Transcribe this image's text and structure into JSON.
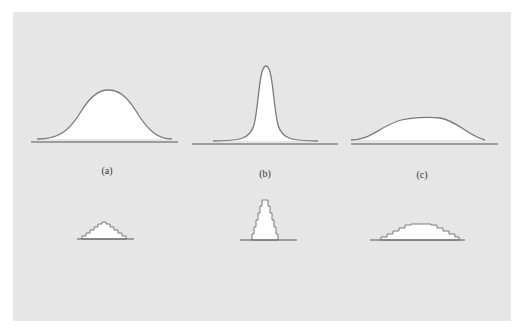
{
  "figure": {
    "background": "#e6e6e6",
    "curve_color": "#7a7a7a",
    "fill_color": "#ffffff",
    "baseline_color": "#555555",
    "panels": [
      {
        "id": "a",
        "label": "(a)",
        "description": "moderate-width bell curve"
      },
      {
        "id": "b",
        "label": "(b)",
        "description": "narrow tall peaked curve"
      },
      {
        "id": "c",
        "label": "(c)",
        "description": "wide flat curve"
      }
    ],
    "histograms": [
      {
        "id": "a",
        "description": "small stepped triangle histogram"
      },
      {
        "id": "b",
        "description": "tall narrow stepped histogram"
      },
      {
        "id": "c",
        "description": "wide flat stepped histogram"
      }
    ]
  }
}
